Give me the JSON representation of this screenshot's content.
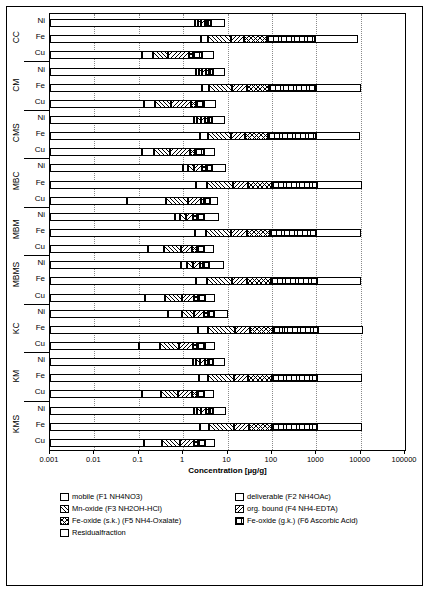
{
  "chart_data": {
    "type": "bar",
    "orientation": "horizontal-stacked",
    "title": "",
    "xlabel": "Concentration [µg/g]",
    "ylabel": "",
    "xscale": "log",
    "xlim": [
      0.001,
      100000
    ],
    "xticks": [
      0.001,
      0.01,
      0.1,
      1,
      10,
      100,
      1000,
      10000,
      100000
    ],
    "xticklabels": [
      "0.001",
      "0.01",
      "0.1",
      "1",
      "10",
      "100",
      "1000",
      "10000",
      "100000"
    ],
    "grid": "vertical-dotted",
    "legend_position": "bottom",
    "groups": [
      "CC",
      "CM",
      "CMS",
      "MBC",
      "MBM",
      "MBMS",
      "KC",
      "KM",
      "KMS"
    ],
    "categories": [
      "Ni",
      "Fe",
      "Cu"
    ],
    "series": [
      {
        "name": "mobile (F1 NH4NO3)",
        "key": "mobile"
      },
      {
        "name": "deliverable (F2 NH4OAc)",
        "key": "deliverable"
      },
      {
        "name": "Mn-oxide (F3 NH2OH-HCl)",
        "key": "mnoxide"
      },
      {
        "name": "org. bound (F4 NH4-EDTA)",
        "key": "org"
      },
      {
        "name": "Fe-oxide (s.k.) (F5 NH4-Oxalate)",
        "key": "fesk"
      },
      {
        "name": "Fe-oxide (g.k.) (F6 Ascorbic Acid)",
        "key": "fegk"
      },
      {
        "name": "Residualfraction",
        "key": "resid"
      }
    ],
    "bars": [
      {
        "group": "CC",
        "cat": "Ni",
        "values": {
          "mobile": 1.9,
          "deliverable": 0.25,
          "mnoxide": 0.35,
          "org": 0.55,
          "fesk": 0.4,
          "fegk": 0.9,
          "resid": 4.5
        }
      },
      {
        "group": "CC",
        "cat": "Fe",
        "values": {
          "mobile": 2.5,
          "deliverable": 1.2,
          "mnoxide": 8,
          "org": 12,
          "fesk": 55,
          "fegk": 850,
          "resid": 8000
        }
      },
      {
        "group": "CC",
        "cat": "Cu",
        "values": {
          "mobile": 0.12,
          "deliverable": 0.09,
          "mnoxide": 0.25,
          "org": 0.9,
          "fesk": 0.35,
          "fegk": 1.0,
          "resid": 2.2
        }
      },
      {
        "group": "CM",
        "cat": "Ni",
        "values": {
          "mobile": 2.0,
          "deliverable": 0.3,
          "mnoxide": 0.4,
          "org": 0.6,
          "fesk": 0.5,
          "fegk": 0.8,
          "resid": 4.0
        }
      },
      {
        "group": "CM",
        "cat": "Fe",
        "values": {
          "mobile": 2.6,
          "deliverable": 1.3,
          "mnoxide": 9,
          "org": 14,
          "fesk": 60,
          "fegk": 900,
          "resid": 9000
        }
      },
      {
        "group": "CM",
        "cat": "Cu",
        "values": {
          "mobile": 0.13,
          "deliverable": 0.1,
          "mnoxide": 0.3,
          "org": 1.0,
          "fesk": 0.4,
          "fegk": 1.1,
          "resid": 2.5
        }
      },
      {
        "group": "CMS",
        "cat": "Ni",
        "values": {
          "mobile": 1.8,
          "deliverable": 0.3,
          "mnoxide": 0.4,
          "org": 0.6,
          "fesk": 0.45,
          "fegk": 0.9,
          "resid": 4.2
        }
      },
      {
        "group": "CMS",
        "cat": "Fe",
        "values": {
          "mobile": 2.4,
          "deliverable": 1.2,
          "mnoxide": 8.5,
          "org": 13,
          "fesk": 58,
          "fegk": 880,
          "resid": 8500
        }
      },
      {
        "group": "CMS",
        "cat": "Cu",
        "values": {
          "mobile": 0.12,
          "deliverable": 0.1,
          "mnoxide": 0.28,
          "org": 0.95,
          "fesk": 0.38,
          "fegk": 1.05,
          "resid": 2.3
        }
      },
      {
        "group": "MBC",
        "cat": "Ni",
        "values": {
          "mobile": 1.0,
          "deliverable": 0.3,
          "mnoxide": 0.5,
          "org": 0.8,
          "fesk": 0.6,
          "fegk": 1.2,
          "resid": 5.0
        }
      },
      {
        "group": "MBC",
        "cat": "Fe",
        "values": {
          "mobile": 2.0,
          "deliverable": 1.5,
          "mnoxide": 10,
          "org": 16,
          "fesk": 70,
          "fegk": 950,
          "resid": 9500
        }
      },
      {
        "group": "MBC",
        "cat": "Cu",
        "values": {
          "mobile": 0.055,
          "deliverable": 0.35,
          "mnoxide": 0.9,
          "org": 1.2,
          "fesk": 0.5,
          "fegk": 1.0,
          "resid": 2.0
        }
      },
      {
        "group": "MBM",
        "cat": "Ni",
        "values": {
          "mobile": 0.65,
          "deliverable": 0.2,
          "mnoxide": 0.3,
          "org": 0.5,
          "fesk": 0.4,
          "fegk": 0.9,
          "resid": 3.5
        }
      },
      {
        "group": "MBM",
        "cat": "Fe",
        "values": {
          "mobile": 1.9,
          "deliverable": 1.4,
          "mnoxide": 9,
          "org": 15,
          "fesk": 65,
          "fegk": 900,
          "resid": 9000
        }
      },
      {
        "group": "MBM",
        "cat": "Cu",
        "values": {
          "mobile": 0.16,
          "deliverable": 0.22,
          "mnoxide": 0.5,
          "org": 0.7,
          "fesk": 0.45,
          "fegk": 0.9,
          "resid": 2.0
        }
      },
      {
        "group": "MBMS",
        "cat": "Ni",
        "values": {
          "mobile": 0.9,
          "deliverable": 0.3,
          "mnoxide": 0.45,
          "org": 0.7,
          "fesk": 0.5,
          "fegk": 1.0,
          "resid": 4.5
        }
      },
      {
        "group": "MBMS",
        "cat": "Fe",
        "values": {
          "mobile": 2.0,
          "deliverable": 1.4,
          "mnoxide": 9.5,
          "org": 15,
          "fesk": 68,
          "fegk": 920,
          "resid": 9200
        }
      },
      {
        "group": "MBMS",
        "cat": "Cu",
        "values": {
          "mobile": 0.14,
          "deliverable": 0.25,
          "mnoxide": 0.55,
          "org": 0.8,
          "fesk": 0.45,
          "fegk": 0.95,
          "resid": 2.1
        }
      },
      {
        "group": "KC",
        "cat": "Ni",
        "values": {
          "mobile": 0.45,
          "deliverable": 0.5,
          "mnoxide": 0.8,
          "org": 1.2,
          "fesk": 0.7,
          "fegk": 1.3,
          "resid": 5.5
        }
      },
      {
        "group": "KC",
        "cat": "Fe",
        "values": {
          "mobile": 2.2,
          "deliverable": 1.5,
          "mnoxide": 11,
          "org": 17,
          "fesk": 75,
          "fegk": 1000,
          "resid": 10000
        }
      },
      {
        "group": "KC",
        "cat": "Cu",
        "values": {
          "mobile": 0.1,
          "deliverable": 0.2,
          "mnoxide": 0.5,
          "org": 0.9,
          "fesk": 0.4,
          "fegk": 1.0,
          "resid": 2.2
        }
      },
      {
        "group": "KM",
        "cat": "Ni",
        "values": {
          "mobile": 1.7,
          "deliverable": 0.3,
          "mnoxide": 0.45,
          "org": 0.7,
          "fesk": 0.5,
          "fegk": 1.0,
          "resid": 4.3
        }
      },
      {
        "group": "KM",
        "cat": "Fe",
        "values": {
          "mobile": 2.3,
          "deliverable": 1.4,
          "mnoxide": 10,
          "org": 15,
          "fesk": 70,
          "fegk": 950,
          "resid": 9500
        }
      },
      {
        "group": "KM",
        "cat": "Cu",
        "values": {
          "mobile": 0.12,
          "deliverable": 0.2,
          "mnoxide": 0.45,
          "org": 0.85,
          "fesk": 0.4,
          "fegk": 0.95,
          "resid": 2.1
        }
      },
      {
        "group": "KMS",
        "cat": "Ni",
        "values": {
          "mobile": 1.8,
          "deliverable": 0.3,
          "mnoxide": 0.45,
          "org": 0.7,
          "fesk": 0.5,
          "fegk": 1.0,
          "resid": 4.4
        }
      },
      {
        "group": "KMS",
        "cat": "Fe",
        "values": {
          "mobile": 2.4,
          "deliverable": 1.4,
          "mnoxide": 10,
          "org": 16,
          "fesk": 72,
          "fegk": 960,
          "resid": 9600
        }
      },
      {
        "group": "KMS",
        "cat": "Cu",
        "values": {
          "mobile": 0.13,
          "deliverable": 0.2,
          "mnoxide": 0.5,
          "org": 0.9,
          "fesk": 0.42,
          "fegk": 1.0,
          "resid": 2.15
        }
      }
    ]
  },
  "axis": {
    "xtitle": "Concentration [µg/g]",
    "ticklabels": [
      "0.001",
      "0.01",
      "0.1",
      "1",
      "10",
      "100",
      "1000",
      "10000",
      "100000"
    ]
  },
  "groups": [
    {
      "label": "CC"
    },
    {
      "label": "CM"
    },
    {
      "label": "CMS"
    },
    {
      "label": "MBC"
    },
    {
      "label": "MBM"
    },
    {
      "label": "MBMS"
    },
    {
      "label": "KC"
    },
    {
      "label": "KM"
    },
    {
      "label": "KMS"
    }
  ],
  "categories": [
    "Ni",
    "Fe",
    "Cu"
  ],
  "legend": [
    {
      "label": "mobile (F1 NH4NO3)",
      "key": "mobile"
    },
    {
      "label": "deliverable (F2 NH4OAc)",
      "key": "deliverable"
    },
    {
      "label": "Mn-oxide (F3 NH2OH-HCl)",
      "key": "mnoxide"
    },
    {
      "label": "org. bound (F4 NH4-EDTA)",
      "key": "org"
    },
    {
      "label": "Fe-oxide (s.k.) (F5 NH4-Oxalate)",
      "key": "fesk"
    },
    {
      "label": "Fe-oxide (g.k.) (F6 Ascorbic Acid)",
      "key": "fegk"
    },
    {
      "label": "Residualfraction",
      "key": "resid"
    }
  ]
}
